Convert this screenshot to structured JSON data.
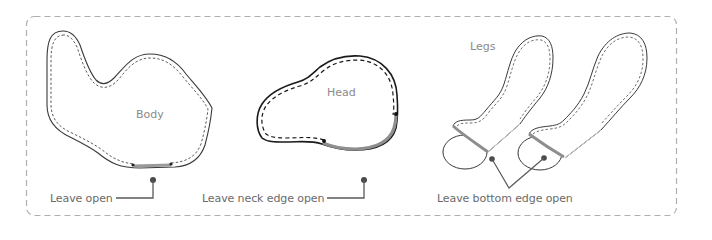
{
  "diagram": {
    "colors": {
      "outline": "#3a3a3a",
      "stitch": "#4a4a4a",
      "open_edge": "#9a9a9a",
      "leader": "#5a5a5a",
      "frame": "#b0b0b0",
      "label_text": "#6a6a6a",
      "part_text": "#8a8a8a"
    },
    "parts": [
      {
        "id": "body",
        "name": "Body",
        "instruction": "Leave open"
      },
      {
        "id": "head",
        "name": "Head",
        "instruction": "Leave neck edge open"
      },
      {
        "id": "legs",
        "name": "Legs",
        "instruction": "Leave bottom edge open"
      }
    ]
  }
}
